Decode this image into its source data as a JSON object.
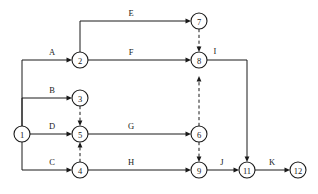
{
  "diagram": {
    "type": "activity-on-arrow-network",
    "title": "",
    "nodes": [
      {
        "id": "1",
        "label": "1",
        "x": 22,
        "y": 134
      },
      {
        "id": "2",
        "label": "2",
        "x": 80,
        "y": 60
      },
      {
        "id": "3",
        "label": "3",
        "x": 80,
        "y": 98
      },
      {
        "id": "4",
        "label": "4",
        "x": 80,
        "y": 170
      },
      {
        "id": "5",
        "label": "5",
        "x": 80,
        "y": 134
      },
      {
        "id": "6",
        "label": "6",
        "x": 199,
        "y": 134
      },
      {
        "id": "7",
        "label": "7",
        "x": 199,
        "y": 21
      },
      {
        "id": "8",
        "label": "8",
        "x": 199,
        "y": 60
      },
      {
        "id": "9",
        "label": "9",
        "x": 199,
        "y": 170
      },
      {
        "id": "11",
        "label": "11",
        "x": 247,
        "y": 170
      },
      {
        "id": "12",
        "label": "12",
        "x": 298,
        "y": 170
      }
    ],
    "node_radius": 8,
    "edges": [
      {
        "id": "A",
        "label": "A",
        "from": "1",
        "to": "2",
        "style": "solid",
        "label_x": 52,
        "label_y": 55
      },
      {
        "id": "B",
        "label": "B",
        "from": "1",
        "to": "3",
        "style": "solid",
        "label_x": 52,
        "label_y": 93
      },
      {
        "id": "C",
        "label": "C",
        "from": "1",
        "to": "4",
        "style": "solid",
        "label_x": 52,
        "label_y": 165
      },
      {
        "id": "D",
        "label": "D",
        "from": "1",
        "to": "5",
        "style": "solid",
        "label_x": 52,
        "label_y": 129
      },
      {
        "id": "E",
        "label": "E",
        "from": "2",
        "to": "7",
        "style": "solid",
        "label_x": 131,
        "label_y": 16
      },
      {
        "id": "F",
        "label": "F",
        "from": "2",
        "to": "8",
        "style": "solid",
        "label_x": 131,
        "label_y": 55
      },
      {
        "id": "G",
        "label": "G",
        "from": "5",
        "to": "6",
        "style": "solid",
        "label_x": 131,
        "label_y": 129
      },
      {
        "id": "H",
        "label": "H",
        "from": "4",
        "to": "9",
        "style": "solid",
        "label_x": 131,
        "label_y": 165
      },
      {
        "id": "I",
        "label": "I",
        "from": "8",
        "to": "11",
        "style": "solid",
        "label_x": 215,
        "label_y": 54
      },
      {
        "id": "J",
        "label": "J",
        "from": "9",
        "to": "11",
        "style": "solid",
        "label_x": 222,
        "label_y": 165
      },
      {
        "id": "K",
        "label": "K",
        "from": "11",
        "to": "12",
        "style": "solid",
        "label_x": 272,
        "label_y": 165
      },
      {
        "id": "d1",
        "label": "",
        "from": "3",
        "to": "5",
        "style": "dashed",
        "label_x": 0,
        "label_y": 0
      },
      {
        "id": "d2",
        "label": "",
        "from": "4",
        "to": "5",
        "style": "dashed",
        "label_x": 0,
        "label_y": 0
      },
      {
        "id": "d3",
        "label": "",
        "from": "7",
        "to": "8",
        "style": "dashed",
        "label_x": 0,
        "label_y": 0
      },
      {
        "id": "d4",
        "label": "",
        "from": "8",
        "to": "6",
        "style": "dashed",
        "label_x": 0,
        "label_y": 0
      },
      {
        "id": "d5",
        "label": "",
        "from": "6",
        "to": "9",
        "style": "dashed",
        "label_x": 0,
        "label_y": 0
      }
    ],
    "colors": {
      "line": "#1a1a1a",
      "node_fill": "#ffffff",
      "background": "#ffffff"
    }
  }
}
